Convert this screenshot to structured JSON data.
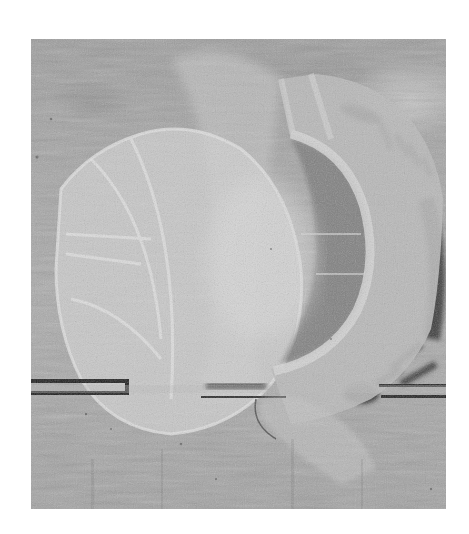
{
  "image": {
    "subject": "Sheer fabric garment pattern pieces laid on a wooden board",
    "style": "grayscale photograph",
    "colors": {
      "page_background": "#ffffff",
      "wood_mid": "#a3a3a3",
      "wood_dark": "#8a8a8a",
      "fabric_light": "#d4d4d4",
      "fabric_shadow": "#7e7e7e",
      "board_seam": "#1e1e1e",
      "fur_dark": "#3a3a3a"
    },
    "elements": [
      "left-fabric-panel",
      "right-curved-collar-piece",
      "center-draped-fabric",
      "dark-fur-texture-right",
      "board-seam-lines",
      "lower-fabric-flap"
    ]
  }
}
